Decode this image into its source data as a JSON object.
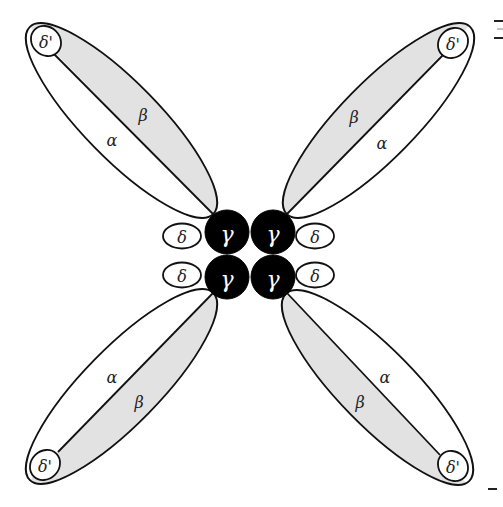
{
  "diagram": {
    "colors": {
      "stroke": "#111111",
      "beta_fill": "#e2e2e2",
      "alpha_fill": "#ffffff",
      "gamma_fill": "#000000",
      "gamma_text": "#ffffff",
      "background": "#ffffff"
    },
    "lobes": [
      {
        "id": "top-left",
        "alpha": "α",
        "beta": "β",
        "delta_prime": "δ'"
      },
      {
        "id": "top-right",
        "alpha": "α",
        "beta": "β",
        "delta_prime": "δ'"
      },
      {
        "id": "bottom-left",
        "alpha": "α",
        "beta": "β",
        "delta_prime": "δ'"
      },
      {
        "id": "bottom-right",
        "alpha": "α",
        "beta": "β",
        "delta_prime": "δ'"
      }
    ],
    "core": {
      "gamma": [
        {
          "id": "top-left",
          "label": "γ"
        },
        {
          "id": "top-right",
          "label": "γ"
        },
        {
          "id": "bottom-left",
          "label": "γ"
        },
        {
          "id": "bottom-right",
          "label": "γ"
        }
      ],
      "delta": [
        {
          "id": "left-top",
          "label": "δ"
        },
        {
          "id": "left-bottom",
          "label": "δ"
        },
        {
          "id": "right-top",
          "label": "δ"
        },
        {
          "id": "right-bottom",
          "label": "δ"
        }
      ]
    }
  }
}
